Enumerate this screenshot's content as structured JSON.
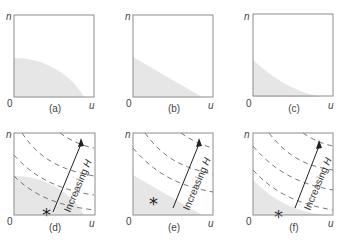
{
  "figure": {
    "axis_labels": {
      "y": "n",
      "x": "u",
      "origin": "0"
    },
    "arrow_label_main": "Increasing ",
    "arrow_label_var": "H",
    "colors": {
      "frame": "#8c8c8c",
      "shade": "#e6e6e6",
      "dash": "#555555",
      "text": "#444444"
    },
    "panels": [
      {
        "id": "a",
        "caption": "(a)"
      },
      {
        "id": "b",
        "caption": "(b)"
      },
      {
        "id": "c",
        "caption": "(c)"
      },
      {
        "id": "d",
        "caption": "(d)"
      },
      {
        "id": "e",
        "caption": "(e)"
      },
      {
        "id": "f",
        "caption": "(f)"
      }
    ]
  }
}
